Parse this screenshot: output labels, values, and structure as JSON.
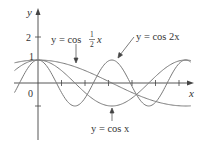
{
  "chart_data": {
    "type": "line",
    "title": "",
    "xlabel": "x",
    "ylabel": "y",
    "xlim": [
      -1,
      6.6
    ],
    "ylim": [
      -2.6,
      3.2
    ],
    "grid": false,
    "legend_position": "annotations",
    "x_ticks": [
      1,
      2,
      3,
      4,
      5,
      6
    ],
    "y_ticks": [
      {
        "value": 2,
        "label": "2"
      },
      {
        "value": 1,
        "label": "1"
      },
      {
        "value": -1,
        "label": ""
      }
    ],
    "origin_label": "0",
    "series": [
      {
        "name": "y = cos x",
        "function": "cos(x)",
        "x_range": [
          -1,
          6.5
        ]
      },
      {
        "name": "y = cos 2x",
        "function": "cos(2x)",
        "x_range": [
          -1,
          6.5
        ]
      },
      {
        "name": "y = cos ½x",
        "function": "cos(x/2)",
        "x_range": [
          -1,
          6.5
        ]
      }
    ],
    "annotations": [
      {
        "text": "y = cos",
        "frac_num": "1",
        "frac_den": "2",
        "tail": "x",
        "series": "cos(x/2)",
        "arrow_to": [
          3.2,
          0.03
        ]
      },
      {
        "text": "y = cos 2x",
        "series": "cos(2x)",
        "arrow_to": [
          0.8,
          0.1
        ]
      },
      {
        "text": "y = cos x",
        "series": "cos(x)",
        "arrow_to": [
          3.14,
          -0.95
        ]
      }
    ]
  },
  "labels": {
    "y_axis": "y",
    "x_axis": "x",
    "origin": "0",
    "tick_2": "2",
    "tick_1": "1",
    "ann_half_prefix": "y = cos",
    "ann_half_num": "1",
    "ann_half_den": "2",
    "ann_half_x": "x",
    "ann_2x": "y = cos 2x",
    "ann_x": "y = cos x"
  },
  "colors": {
    "axis": "#444444",
    "curve": "#7a7a7a",
    "text": "#333333"
  }
}
